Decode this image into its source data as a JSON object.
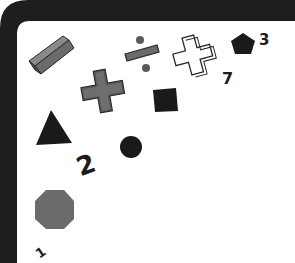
{
  "scene": {
    "description": "Illustration of math symbols and geometric shapes inside a dark rounded frame",
    "frame_color": "#1e1e1e",
    "background_color": "#ffffff",
    "shape_gray": "#6b6b6b",
    "shape_dark": "#1a1a1a"
  },
  "shapes": [
    {
      "name": "minus-bar",
      "kind": "3d-bar",
      "color": "gray"
    },
    {
      "name": "division-sign",
      "kind": "divide",
      "color": "gray"
    },
    {
      "name": "outlined-plus",
      "kind": "plus-outline",
      "color": "white"
    },
    {
      "name": "pentagon",
      "kind": "pentagon",
      "color": "black"
    },
    {
      "name": "multiply-sign",
      "kind": "times",
      "color": "gray"
    },
    {
      "name": "square",
      "kind": "square",
      "color": "black"
    },
    {
      "name": "triangle",
      "kind": "triangle",
      "color": "black"
    },
    {
      "name": "circle",
      "kind": "circle",
      "color": "black"
    },
    {
      "name": "octagon",
      "kind": "octagon",
      "color": "gray"
    }
  ],
  "numbers": {
    "n1": "1",
    "n2": "2",
    "n3": "3",
    "n7": "7"
  }
}
